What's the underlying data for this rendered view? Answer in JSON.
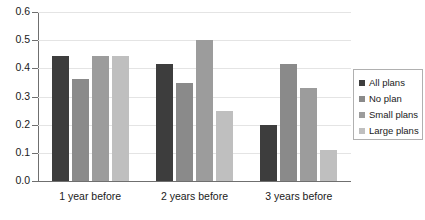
{
  "chart_data": {
    "type": "bar",
    "title": "",
    "xlabel": "",
    "ylabel": "",
    "ylim": [
      0.0,
      0.6
    ],
    "ytick_labels": [
      "0.0",
      "0.1",
      "0.2",
      "0.3",
      "0.4",
      "0.5",
      "0.6"
    ],
    "ytick_values": [
      0.0,
      0.1,
      0.2,
      0.3,
      0.4,
      0.5,
      0.6
    ],
    "grid": true,
    "legend_position": "right",
    "categories": [
      "1 year before",
      "2 years before",
      "3 years before"
    ],
    "series": [
      {
        "name": "All plans",
        "color": "#3d3d3d",
        "values": [
          0.445,
          0.415,
          0.2
        ]
      },
      {
        "name": "No plan",
        "color": "#8a8a8a",
        "values": [
          0.363,
          0.348,
          0.415
        ]
      },
      {
        "name": "Small plans",
        "color": "#9c9c9c",
        "values": [
          0.445,
          0.5,
          0.33
        ]
      },
      {
        "name": "Large plans",
        "color": "#bfbfbf",
        "values": [
          0.445,
          0.248,
          0.11
        ]
      }
    ]
  },
  "colors": {
    "background": "#ffffff",
    "axis": "#6f6f6f",
    "gridline": "#e4e4e4",
    "text": "#1a1a1a",
    "legend_border": "#b0b0b0"
  }
}
